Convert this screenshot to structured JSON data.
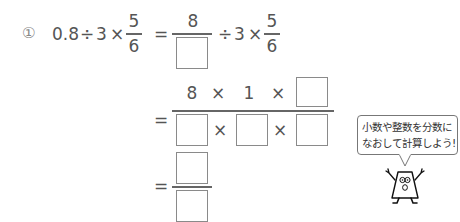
{
  "problem": {
    "number_label": "①",
    "expression": {
      "decimal": "0.8",
      "div": "÷",
      "three": "3",
      "times": "×",
      "frac_num": "5",
      "frac_den": "6"
    },
    "step1": {
      "eq": "=",
      "num": "8",
      "div": "÷",
      "three": "3",
      "times": "×",
      "frac_num": "5",
      "frac_den": "6"
    },
    "step2": {
      "eq": "=",
      "numerator": [
        "8",
        "×",
        "1",
        "×"
      ],
      "denominator_ops": [
        "×",
        "×"
      ]
    },
    "step3": {
      "eq": "="
    }
  },
  "hint": {
    "line1": "小数や整数を分数に",
    "line2": "なおして計算しよう!"
  }
}
